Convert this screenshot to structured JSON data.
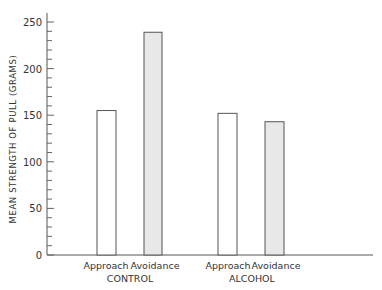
{
  "chart_data": {
    "type": "bar",
    "title": "",
    "xlabel": "",
    "ylabel": "MEAN STRENGTH OF PULL (GRAMS)",
    "ylim": [
      0,
      260
    ],
    "yticks_major": [
      0,
      50,
      100,
      150,
      200,
      250
    ],
    "ytick_minor_step": 10,
    "grid": false,
    "legend": null,
    "groups": [
      "CONTROL",
      "ALCOHOL"
    ],
    "categories": [
      "Approach",
      "Avoidance"
    ],
    "series": [
      {
        "group": "CONTROL",
        "name": "Approach",
        "value": 155,
        "fill": "#ffffff"
      },
      {
        "group": "CONTROL",
        "name": "Avoidance",
        "value": 239,
        "fill": "#e8e8e8"
      },
      {
        "group": "ALCOHOL",
        "name": "Approach",
        "value": 152,
        "fill": "#ffffff"
      },
      {
        "group": "ALCOHOL",
        "name": "Avoidance",
        "value": 143,
        "fill": "#e8e8e8"
      }
    ]
  },
  "axis": {
    "ylabel": "MEAN STRENGTH OF PULL (GRAMS)",
    "tick_labels": [
      "0",
      "50",
      "100",
      "150",
      "200",
      "250"
    ]
  },
  "bars": [
    {
      "label": "Approach"
    },
    {
      "label": "Avoidance"
    },
    {
      "label": "Approach"
    },
    {
      "label": "Avoidance"
    }
  ],
  "groups": [
    {
      "label": "CONTROL"
    },
    {
      "label": "ALCOHOL"
    }
  ],
  "colors": {
    "axis": "#555555",
    "bar_stroke": "#555555",
    "open_fill": "#ffffff",
    "shaded_fill": "#e8e8e8"
  }
}
